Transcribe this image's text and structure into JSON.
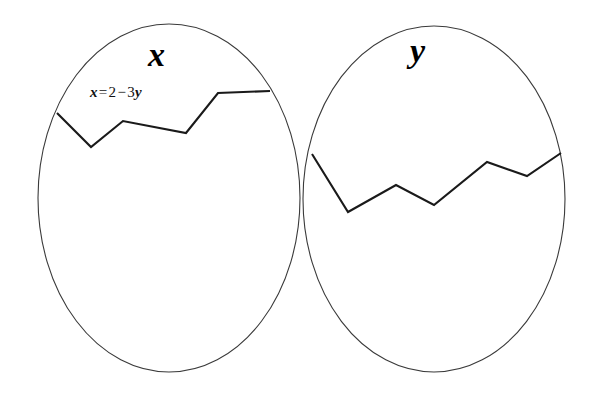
{
  "figure": {
    "background_color": "#ffffff",
    "stroke_color": "#3a3a3a",
    "zigzag_color": "#1a1a1a",
    "width": 597,
    "height": 400,
    "sets": [
      {
        "id": "set-x",
        "label": "x",
        "ellipse": {
          "cx": 169,
          "cy": 198,
          "rx": 131,
          "ry": 174
        },
        "zigzag_points": "57,113 91,147 123,121 186,133 218,93 270,91",
        "annotation": {
          "full_text": "x = 2 - 3y",
          "lhs": "x",
          "equals": "=",
          "coefficient": "2",
          "minus": "−",
          "term_coefficient": "3",
          "rhs_var": "y"
        }
      },
      {
        "id": "set-y",
        "label": "y",
        "ellipse": {
          "cx": 434,
          "cy": 199,
          "rx": 131,
          "ry": 173
        },
        "zigzag_points": "312,154 348,212 396,185 434,205 487,162 527,176 561,153",
        "annotation": null
      }
    ]
  }
}
